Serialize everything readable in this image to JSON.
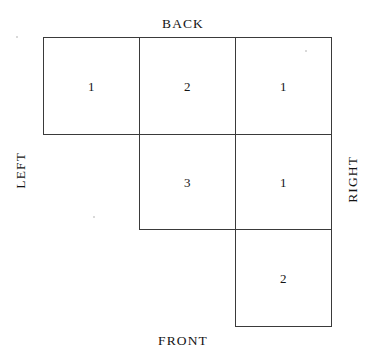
{
  "figure": {
    "type": "plan-view-block-diagram",
    "labels": {
      "back": "BACK",
      "front": "FRONT",
      "left": "LEFT",
      "right": "RIGHT"
    },
    "line_color": "#3a3a3a",
    "text_color": "#141414",
    "background_color": "#ffffff"
  },
  "grid": {
    "rows": [
      {
        "row_index": 0,
        "name": "back-row",
        "cells": [
          {
            "col": 0,
            "value": "1",
            "x": 43,
            "y": 37,
            "w": 97,
            "h": 98
          },
          {
            "col": 1,
            "value": "2",
            "x": 139,
            "y": 37,
            "w": 97,
            "h": 98
          },
          {
            "col": 2,
            "value": "1",
            "x": 235,
            "y": 37,
            "w": 97,
            "h": 98
          }
        ]
      },
      {
        "row_index": 1,
        "name": "middle-row",
        "cells": [
          {
            "col": 1,
            "value": "3",
            "x": 139,
            "y": 134,
            "w": 97,
            "h": 96
          },
          {
            "col": 2,
            "value": "1",
            "x": 235,
            "y": 134,
            "w": 97,
            "h": 96
          }
        ]
      },
      {
        "row_index": 2,
        "name": "front-row",
        "cells": [
          {
            "col": 2,
            "value": "2",
            "x": 235,
            "y": 229,
            "w": 97,
            "h": 98
          }
        ]
      }
    ]
  }
}
